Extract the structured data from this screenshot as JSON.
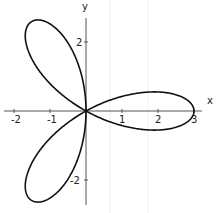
{
  "chart_data": {
    "type": "line",
    "subtype": "polar-curve",
    "equation": "r = 3 cos(3θ)",
    "title": "",
    "xlabel": "x",
    "ylabel": "y",
    "x_ticks": [
      -2,
      -1,
      1,
      2,
      3
    ],
    "y_ticks": [
      2,
      -2
    ],
    "x_tick_labels": [
      "-2",
      "-1",
      "1",
      "2",
      "3"
    ],
    "y_tick_labels": [
      "2",
      "-2"
    ],
    "xlim": [
      -2.4,
      3.5
    ],
    "ylim": [
      -2.8,
      3.1
    ],
    "grid": false,
    "legend": null,
    "series": [
      {
        "name": "rose",
        "petals": 3,
        "amplitude": 3,
        "petal_tips": [
          [
            3,
            0
          ],
          [
            -1.5,
            2.598
          ],
          [
            -1.5,
            -2.598
          ]
        ]
      }
    ],
    "colors": {
      "curve": "#111111",
      "axis": "#555555",
      "background": "#ffffff"
    }
  },
  "axes": {
    "x_label": "x",
    "y_label": "y"
  }
}
